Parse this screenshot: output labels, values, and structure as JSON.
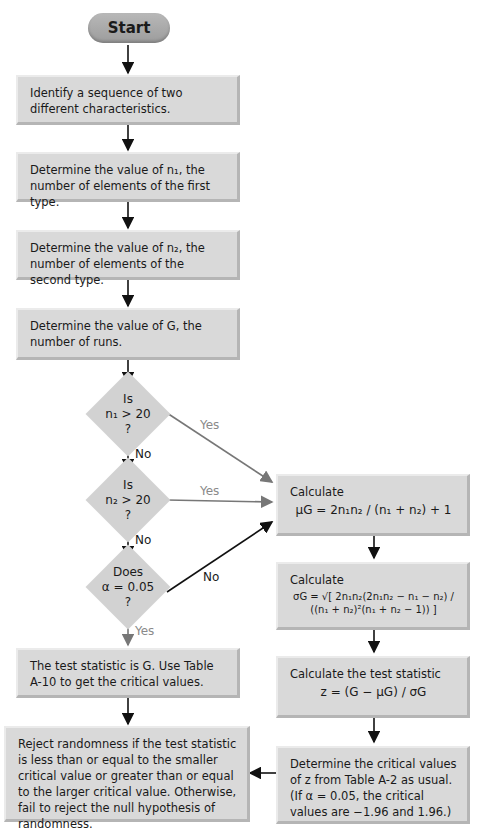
{
  "start": {
    "label": "Start"
  },
  "steps": [
    {
      "text": "Identify a sequence of two different characteristics."
    },
    {
      "text": "Determine the value of n₁, the number of elements of the first type."
    },
    {
      "text": "Determine the value of n₂, the number of elements of the second type."
    },
    {
      "text": "Determine the value of G, the number of runs."
    }
  ],
  "decisions": [
    {
      "line1": "Is",
      "line2": "n₁ > 20",
      "line3": "?",
      "yes": "Yes",
      "no": "No"
    },
    {
      "line1": "Is",
      "line2": "n₂ > 20",
      "line3": "?",
      "yes": "Yes",
      "no": "No"
    },
    {
      "line1": "Does",
      "line2": "α = 0.05",
      "line3": "?",
      "yes": "Yes",
      "no": "No"
    }
  ],
  "right": {
    "mean": {
      "title": "Calculate",
      "formula": "μG = 2n₁n₂ / (n₁ + n₂) + 1"
    },
    "sd": {
      "title": "Calculate",
      "formula": "σG = √[ 2n₁n₂(2n₁n₂ − n₁ − n₂) / ((n₁ + n₂)²(n₁ + n₂ − 1)) ]"
    },
    "z": {
      "title": "Calculate the test statistic",
      "formula": "z = (G − μG) / σG"
    },
    "crit": {
      "text": "Determine the critical values of z from Table A-2 as usual. (If α = 0.05, the critical values are −1.96 and 1.96.)"
    }
  },
  "left": {
    "small": {
      "text": "The test statistic is G. Use Table A-10 to get the critical values."
    },
    "reject": {
      "text": "Reject randomness if the test statistic is less than or equal to the smaller critical value or greater than or equal to the larger critical value. Otherwise, fail to reject the null hypothesis of randomness."
    }
  }
}
